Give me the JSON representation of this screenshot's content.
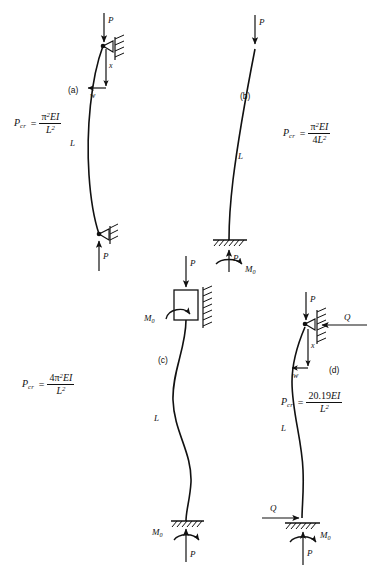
{
  "figure": {
    "background": "#ffffff",
    "ink": "#111111",
    "width": 383,
    "height": 571
  },
  "panels": [
    {
      "id": "a",
      "tag": "(a)",
      "name": "pinned-pinned-column",
      "description": "Column pinned at top and bottom, single half sine wave buckling shape",
      "formula": {
        "lhs": "P",
        "lhs_sub": "cr",
        "equals": "=",
        "numerator": "π²EI",
        "numerator_pi": "π",
        "numerator_pi_exp": "2",
        "numerator_rest": "EI",
        "denominator": "L",
        "denominator_exp": "2",
        "plain": "P_cr = π²EI / L²"
      },
      "labels": {
        "load_top": "P",
        "load_bottom": "P",
        "length": "L",
        "axis_x": "x",
        "deflection_w": "w"
      },
      "supports": {
        "top": "pin-roller-wall",
        "bottom": "pin-roller-wall"
      }
    },
    {
      "id": "b",
      "tag": "(b)",
      "name": "fixed-free-cantilever-column",
      "description": "Cantilever column fixed at base, free at top, quarter sine wave",
      "formula": {
        "lhs": "P",
        "lhs_sub": "cr",
        "equals": "=",
        "numerator_pi": "π",
        "numerator_pi_exp": "2",
        "numerator_rest": "EI",
        "denominator_coeff": "4",
        "denominator": "L",
        "denominator_exp": "2",
        "plain": "P_cr = π²EI / 4L²"
      },
      "labels": {
        "load_top": "P",
        "load_bottom": "P",
        "length": "L",
        "moment_base": "M",
        "moment_base_sub": "0"
      },
      "supports": {
        "top": "free",
        "bottom": "fixed-ground"
      }
    },
    {
      "id": "c",
      "tag": "(c)",
      "name": "fixed-fixed-sliding-column",
      "description": "Column fixed at base and guided sliding block at top, full sine wave buckling shape",
      "formula": {
        "lhs": "P",
        "lhs_sub": "cr",
        "equals": "=",
        "numerator_coeff": "4",
        "numerator_pi": "π",
        "numerator_pi_exp": "2",
        "numerator_rest": "EI",
        "denominator": "L",
        "denominator_exp": "2",
        "plain": "P_cr = 4π²EI / L²"
      },
      "labels": {
        "load_top": "P",
        "load_bottom": "P",
        "length": "L",
        "moment_top": "M",
        "moment_top_sub": "0",
        "moment_base": "M",
        "moment_base_sub": "0"
      },
      "supports": {
        "top": "sliding-block-wall",
        "bottom": "fixed-ground"
      }
    },
    {
      "id": "d",
      "tag": "(d)",
      "name": "fixed-pinned-column",
      "description": "Column fixed at base, pinned roller at top against wall, with transverse reaction Q",
      "formula": {
        "lhs": "P",
        "lhs_sub": "cr",
        "equals": "=",
        "numerator": "20.19EI",
        "numerator_coeff": "20.19",
        "numerator_rest": "EI",
        "denominator": "L",
        "denominator_exp": "2",
        "plain": "P_cr = 20.19EI / L²"
      },
      "labels": {
        "load_top": "P",
        "load_bottom": "P",
        "length": "L",
        "axis_x": "x",
        "deflection_w": "w",
        "shear_top": "Q",
        "shear_base": "Q",
        "moment_base": "M",
        "moment_base_sub": "0"
      },
      "supports": {
        "top": "pin-roller-wall",
        "bottom": "fixed-ground"
      }
    }
  ]
}
